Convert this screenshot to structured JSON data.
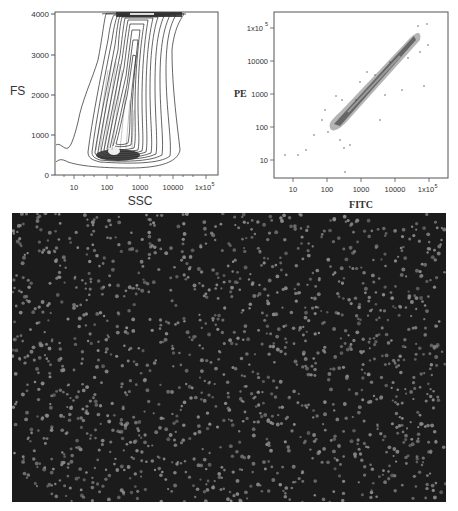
{
  "figure": {
    "panel_left": {
      "type": "contour",
      "ylabel": "FS",
      "xlabel": "SSC",
      "yticks": [
        "0",
        "1000",
        "2000",
        "3000",
        "4000"
      ],
      "xticks": [
        "10",
        "100",
        "1000",
        "10000",
        "1x10^5"
      ],
      "xtick_main": [
        "10",
        "100",
        "1000",
        "10000",
        "1x10"
      ],
      "xtick_last_sup": "5"
    },
    "panel_right": {
      "type": "scatter",
      "ylabel": "PE",
      "xlabel": "FITC",
      "yticks": [
        "10",
        "100",
        "1000",
        "10000",
        "1x10"
      ],
      "ytick_last_sup": "5",
      "xticks": [
        "10",
        "100",
        "1000",
        "10000",
        "1x10"
      ],
      "xtick_last_sup": "5"
    },
    "panel_bottom": {
      "type": "fluorescence-micrograph",
      "background_color": "#1b1b1b",
      "particle_color": "#8a8a8a"
    }
  },
  "chart_data": [
    {
      "type": "contour",
      "title": "",
      "xlabel": "SSC",
      "ylabel": "FS",
      "xscale": "log",
      "xlim": [
        3,
        300000
      ],
      "ylim": [
        -50,
        4100
      ],
      "x_tick_labels": [
        "10",
        "100",
        "1000",
        "10000",
        "1x10^5"
      ],
      "y_tick_labels": [
        "0",
        "1000",
        "2000",
        "3000",
        "4000"
      ],
      "description": "Dense population centered around SSC 100-1000, FS 300-4000, densest near FS ~400 at SSC ~150-500; saturation band at FS 4000",
      "density_peak": {
        "x": 250,
        "y": 450
      }
    },
    {
      "type": "scatter",
      "title": "",
      "xlabel": "FITC",
      "ylabel": "PE",
      "xscale": "log",
      "yscale": "log",
      "xlim": [
        3,
        300000
      ],
      "ylim": [
        3,
        300000
      ],
      "x_tick_labels": [
        "10",
        "100",
        "1000",
        "10000",
        "1x10^5"
      ],
      "y_tick_labels": [
        "10",
        "100",
        "1000",
        "10000",
        "1x10^5"
      ],
      "description": "Diagonal correlated population from ~(200,100) to ~(50000,60000)",
      "trend_points": [
        [
          200,
          100
        ],
        [
          1000,
          600
        ],
        [
          5000,
          4000
        ],
        [
          20000,
          20000
        ],
        [
          50000,
          60000
        ]
      ]
    }
  ]
}
